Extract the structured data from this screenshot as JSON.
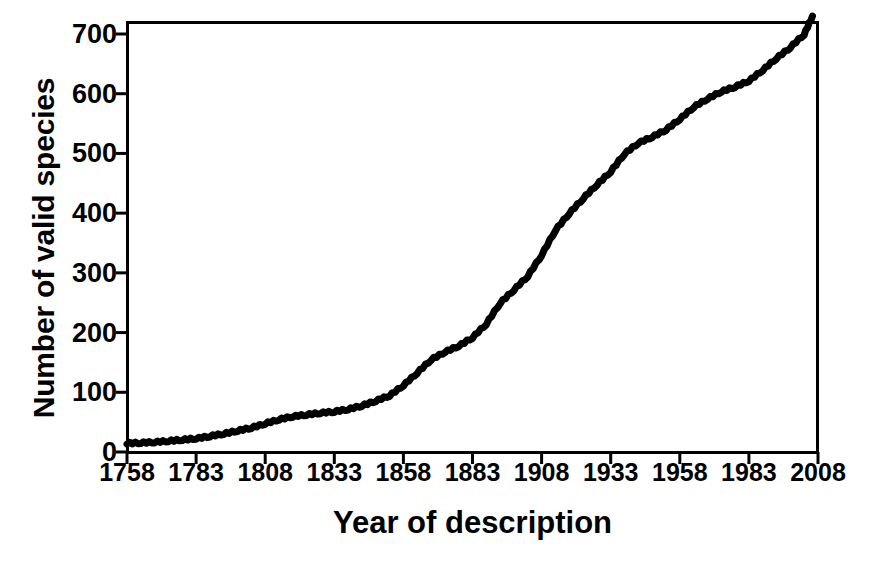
{
  "figure": {
    "background_color": "#ffffff",
    "line_color": "#000000",
    "axis_color": "#000000"
  },
  "axes": {
    "ylabel": "Number of valid species",
    "xlabel": "Year of description",
    "yticks": [
      "0",
      "100",
      "200",
      "300",
      "400",
      "500",
      "600",
      "700"
    ],
    "xticks": [
      "1758",
      "1783",
      "1808",
      "1833",
      "1858",
      "1883",
      "1908",
      "1933",
      "1958",
      "1983",
      "2008"
    ]
  },
  "caption_remnant": ".  .   .      .    .       .        .         .      .",
  "chart_data": {
    "type": "line",
    "title": "",
    "xlabel": "Year of description",
    "ylabel": "Number of valid species",
    "xlim": [
      1758,
      2008
    ],
    "ylim": [
      0,
      730
    ],
    "grid": false,
    "legend": null,
    "series": [
      {
        "name": "Cumulative valid species described",
        "x": [
          1758,
          1763,
          1768,
          1773,
          1778,
          1783,
          1788,
          1793,
          1798,
          1803,
          1808,
          1813,
          1818,
          1823,
          1828,
          1833,
          1838,
          1843,
          1848,
          1853,
          1858,
          1863,
          1868,
          1873,
          1878,
          1883,
          1888,
          1893,
          1898,
          1903,
          1908,
          1913,
          1918,
          1923,
          1928,
          1933,
          1938,
          1943,
          1948,
          1953,
          1958,
          1963,
          1968,
          1973,
          1978,
          1983,
          1988,
          1993,
          1998,
          2003,
          2006
        ],
        "y": [
          15,
          16,
          17,
          19,
          21,
          23,
          27,
          31,
          36,
          41,
          48,
          55,
          60,
          63,
          66,
          68,
          72,
          78,
          86,
          95,
          112,
          133,
          155,
          168,
          178,
          192,
          215,
          250,
          272,
          295,
          330,
          372,
          400,
          425,
          448,
          470,
          500,
          518,
          528,
          540,
          558,
          578,
          592,
          604,
          612,
          622,
          640,
          660,
          678,
          700,
          730
        ]
      }
    ]
  }
}
